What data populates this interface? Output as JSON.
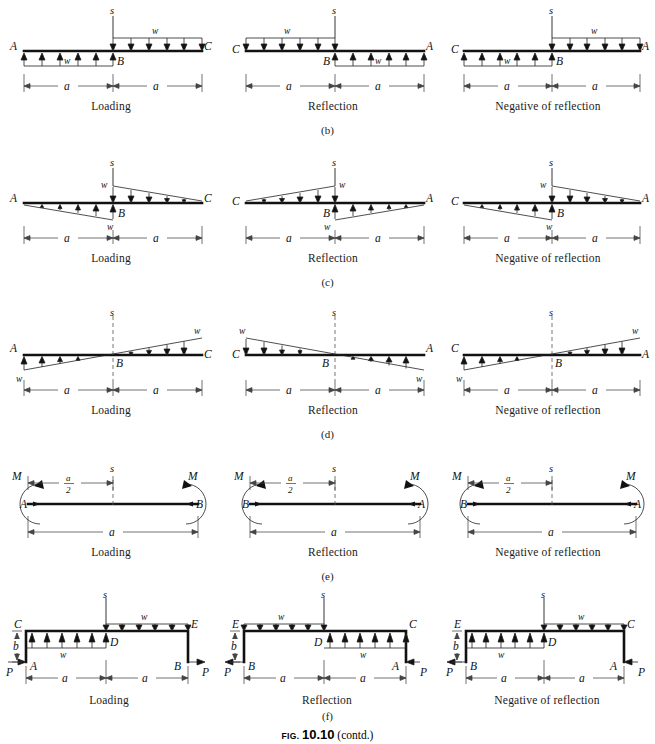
{
  "figure": {
    "caption_prefix": "FIG.",
    "caption_number": "10.10",
    "caption_suffix": "(contd.)"
  },
  "column_captions": {
    "loading": "Loading",
    "reflection": "Reflection",
    "negative": "Negative of reflection"
  },
  "row_labels": {
    "b": "(b)",
    "c": "(c)",
    "d": "(d)",
    "e": "(e)",
    "f": "(f)"
  },
  "symbols": {
    "A": "A",
    "B": "B",
    "C": "C",
    "D": "D",
    "E": "E",
    "s": "s",
    "w": "w",
    "a": "a",
    "M": "M",
    "P": "P",
    "b": "b",
    "half_num": "a",
    "half_den": "2"
  },
  "rows": [
    {
      "id": "b",
      "description": "Uniformly distributed load w, stepped: upward on left span, downward on right span",
      "panels": [
        {
          "caption": "Loading",
          "left_end": "A",
          "mid": "B",
          "right_end": "C",
          "left_span_label": "w",
          "right_span_label": "w",
          "left_dim": "a",
          "right_dim": "a",
          "axis": "s"
        },
        {
          "caption": "Reflection",
          "left_end": "C",
          "mid": "B",
          "right_end": "A",
          "left_span_label": "w",
          "right_span_label": "w",
          "left_dim": "a",
          "right_dim": "a",
          "axis": "s"
        },
        {
          "caption": "Negative of reflection",
          "left_end": "C",
          "mid": "B",
          "right_end": "A",
          "left_span_label": "w",
          "right_span_label": "w",
          "left_dim": "a",
          "right_dim": "a",
          "axis": "s"
        }
      ]
    },
    {
      "id": "c",
      "description": "Triangular loads peaking at centre B, zero at outer ends",
      "panels": [
        {
          "caption": "Loading",
          "left_end": "A",
          "mid": "B",
          "right_end": "C",
          "left_span_label": "w",
          "right_span_label": "w",
          "left_dim": "a",
          "right_dim": "a",
          "axis": "s"
        },
        {
          "caption": "Reflection",
          "left_end": "C",
          "mid": "B",
          "right_end": "A",
          "left_span_label": "w",
          "right_span_label": "w",
          "left_dim": "a",
          "right_dim": "a",
          "axis": "s"
        },
        {
          "caption": "Negative of reflection",
          "left_end": "C",
          "mid": "B",
          "right_end": "A",
          "left_span_label": "w",
          "right_span_label": "w",
          "left_dim": "a",
          "right_dim": "a",
          "axis": "s"
        }
      ]
    },
    {
      "id": "d",
      "description": "Linearly varying load crossing zero at centre B, magnitude w at both outer ends",
      "panels": [
        {
          "caption": "Loading",
          "left_end": "A",
          "mid": "B",
          "right_end": "C",
          "left_span_label": "w",
          "right_span_label": "w",
          "left_dim": "a",
          "right_dim": "a",
          "axis": "s"
        },
        {
          "caption": "Reflection",
          "left_end": "C",
          "mid": "B",
          "right_end": "A",
          "left_span_label": "w",
          "right_span_label": "w",
          "left_dim": "a",
          "right_dim": "a",
          "axis": "s"
        },
        {
          "caption": "Negative of reflection",
          "left_end": "C",
          "mid": "B",
          "right_end": "A",
          "left_span_label": "w",
          "right_span_label": "w",
          "left_dim": "a",
          "right_dim": "a",
          "axis": "s"
        }
      ]
    },
    {
      "id": "e",
      "description": "Straight member with end moments M applied at both ends",
      "panels": [
        {
          "caption": "Loading",
          "left_end": "A",
          "right_end": "B",
          "left_moment": "M",
          "right_moment": "M",
          "half_dim_num": "a",
          "half_dim_den": "2",
          "full_dim": "a",
          "axis": "s"
        },
        {
          "caption": "Reflection",
          "left_end": "B",
          "right_end": "A",
          "left_moment": "M",
          "right_moment": "M",
          "half_dim_num": "a",
          "half_dim_den": "2",
          "full_dim": "a",
          "axis": "s"
        },
        {
          "caption": "Negative of reflection",
          "left_end": "B",
          "right_end": "A",
          "left_moment": "M",
          "right_moment": "M",
          "half_dim_num": "a",
          "half_dim_den": "2",
          "full_dim": "a",
          "axis": "s"
        }
      ]
    },
    {
      "id": "f",
      "description": "Portal frame with legs of height b, horizontal forces P at base, stepped distributed load w on top girder",
      "panels": [
        {
          "caption": "Loading",
          "base_left": "A",
          "base_right": "B",
          "top_left": "C",
          "top_mid": "D",
          "top_right": "E",
          "left_span_label": "w",
          "right_span_label": "w",
          "left_dim": "a",
          "right_dim": "a",
          "height_dim": "b",
          "left_force": "P",
          "right_force": "P",
          "axis": "s"
        },
        {
          "caption": "Reflection",
          "base_left": "B",
          "base_right": "A",
          "top_left": "E",
          "top_mid": "D",
          "top_right": "C",
          "left_span_label": "w",
          "right_span_label": "w",
          "left_dim": "a",
          "right_dim": "a",
          "height_dim": "b",
          "left_force": "P",
          "right_force": "P",
          "axis": "s"
        },
        {
          "caption": "Negative of reflection",
          "base_left": "B",
          "base_right": "A",
          "top_left": "E",
          "top_mid": "D",
          "top_right": "C",
          "left_span_label": "w",
          "right_span_label": "w",
          "left_dim": "a",
          "right_dim": "a",
          "height_dim": "b",
          "left_force": "P",
          "right_force": "P",
          "axis": "s"
        }
      ]
    }
  ]
}
